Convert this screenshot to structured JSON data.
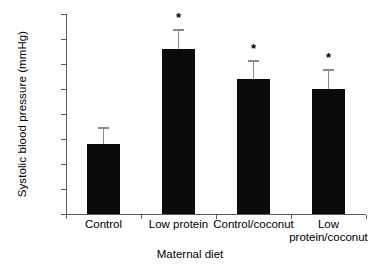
{
  "chart_data": {
    "type": "bar",
    "title": "",
    "xlabel": "Maternal diet",
    "ylabel": "Systolic blood pressure (mmHg)",
    "categories": [
      "Control",
      "Low protein",
      "Control/coconut",
      "Low protein/coconut"
    ],
    "category_labels_display": [
      "Control",
      "Low protein",
      "Control/coconut",
      "Low\nprotein/coconut"
    ],
    "values": [
      124,
      143,
      137,
      135
    ],
    "errors": [
      3.4,
      4.0,
      3.8,
      4.0
    ],
    "significance": [
      "",
      "*",
      "*",
      "*"
    ],
    "ylim": [
      110,
      150
    ],
    "yticks": [
      110,
      115,
      120,
      125,
      130,
      135,
      140,
      145,
      150
    ],
    "ytick_labels": [
      "110",
      "115",
      "120",
      "125",
      "130",
      "135",
      "140",
      "145",
      "150"
    ],
    "grid": false,
    "legend": null,
    "bar_color": "#0a0a0a",
    "axis_color": "#5a5a5a",
    "error_bar_color": "#8a8a8a",
    "annotations": [
      {
        "text": "*",
        "category": "Low protein",
        "meaning": "significant-vs-control"
      },
      {
        "text": "*",
        "category": "Control/coconut",
        "meaning": "significant-vs-control"
      },
      {
        "text": "*",
        "category": "Low protein/coconut",
        "meaning": "significant-vs-control"
      }
    ]
  }
}
